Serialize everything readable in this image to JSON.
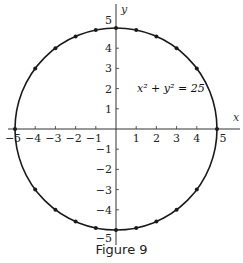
{
  "figure": {
    "caption": "Figure 9",
    "equation": "x² + y² = 25",
    "x_axis_label": "x",
    "y_axis_label": "y",
    "x_tick_labels": [
      "−5",
      "−4",
      "−3",
      "−2",
      "−1",
      "1",
      "2",
      "3",
      "4",
      "5"
    ],
    "y_tick_labels": [
      "5",
      "4",
      "3",
      "2",
      "1",
      "−1",
      "−2",
      "−3",
      "−4",
      "−5"
    ],
    "colors": {
      "curve": "#1a1a1a",
      "axes": "#333333",
      "background": "#ffffff"
    }
  },
  "chart_data": {
    "type": "scatter",
    "title": "Figure 9",
    "annotation": "x² + y² = 25",
    "xlabel": "x",
    "ylabel": "y",
    "xlim": [
      -5.5,
      5.5
    ],
    "ylim": [
      -5.5,
      5.5
    ],
    "grid": false,
    "curve": {
      "shape": "circle",
      "center": [
        0,
        0
      ],
      "radius": 5
    },
    "points": [
      [
        -5,
        0
      ],
      [
        -4,
        3
      ],
      [
        -3,
        4
      ],
      [
        -2,
        4.58
      ],
      [
        -1,
        4.9
      ],
      [
        0,
        5
      ],
      [
        1,
        4.9
      ],
      [
        2,
        4.58
      ],
      [
        3,
        4
      ],
      [
        4,
        3
      ],
      [
        5,
        0
      ],
      [
        -4,
        -3
      ],
      [
        -3,
        -4
      ],
      [
        -2,
        -4.58
      ],
      [
        -1,
        -4.9
      ],
      [
        0,
        -5
      ],
      [
        1,
        -4.9
      ],
      [
        2,
        -4.58
      ],
      [
        3,
        -4
      ],
      [
        4,
        -3
      ]
    ]
  }
}
